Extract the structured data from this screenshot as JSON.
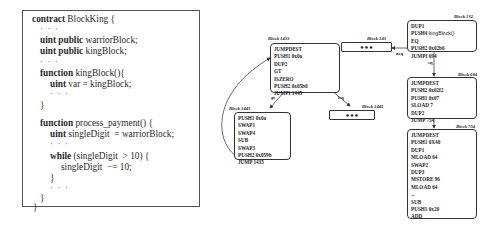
{
  "code": {
    "lines": [
      {
        "kw": "contract",
        "rest": " BlockKing {"
      },
      {
        "dots": "· · ·"
      },
      {
        "kw": "uint public",
        "rest": " warriorBlock;"
      },
      {
        "kw": "uint public",
        "rest": " kingBlock;"
      },
      {
        "dots": "· · ·"
      },
      {
        "kw": "function",
        "rest": " kingBlock(){"
      },
      {
        "kw": "uint",
        "rest": " var = kingBlock;"
      },
      {
        "dots": "· · ·"
      },
      {
        "rest": "}"
      },
      {
        "kw": "function",
        "rest": " process_payment() {"
      },
      {
        "kw": "uint",
        "rest": " singleDigit  = warriorBlock;"
      },
      {
        "dots": "· · ·"
      },
      {
        "kw": "while",
        "rest": " (singleDigit  > 10) {"
      },
      {
        "rest": "singleDigit  −= 10;"
      },
      {
        "rest": "}"
      },
      {
        "dots": "· · ·"
      },
      {
        "rest": "}"
      },
      {
        "rest": "}"
      }
    ]
  },
  "cfg": {
    "blocks": {
      "b1433": {
        "label": "Block 1433",
        "instructions": [
          "JUMPDEST",
          "PUSH1 0x0a",
          "DUP2",
          "GT",
          "ISZERO",
          "PUSH2 0x05b0",
          "JUMPI 1445"
        ]
      },
      "b1443": {
        "label": "Block 1443",
        "instructions": [
          "PUSH1 0x0a",
          "SWAP1",
          "SWAP4",
          "SUB",
          "SWAP3",
          "PUSH2 0x059b",
          "JUMP 1435"
        ]
      },
      "b1445": {
        "label": "Block 1445",
        "content": "•••"
      },
      "b143": {
        "label": "Block 143",
        "content": "•••"
      },
      "b132": {
        "label": "Block 132",
        "instructions": [
          "DUP1",
          "PUSH4",
          "EQ",
          "PUSH2 0x02b6",
          "JUMPI 694"
        ],
        "push4_arg": "kingBlock()"
      },
      "b694": {
        "label": "Block 694",
        "instructions": [
          "JUMPDEST",
          "PUSH2 0x02f2",
          "PUSH1 0x07",
          "SLOAD 7",
          "DUP2",
          "JUMP 754"
        ]
      },
      "b754": {
        "label": "Block 754",
        "instructions": [
          "JUMPDEST",
          "PUSH1 0X40",
          "DUP1",
          "MLOAD 64",
          "SWAP2",
          "DUP3",
          "MSTORE 96",
          "MLOAD 64",
          "...",
          "SUB",
          "PUSH1 0x20",
          "ADD",
          "..."
        ]
      }
    },
    "edges": {
      "gt": "gt",
      "leq": "leq",
      "neq": "neq",
      "eq": "eq"
    }
  }
}
